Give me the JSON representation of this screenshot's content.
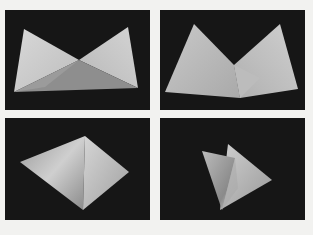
{
  "figure": {
    "background": "#f2f2f0",
    "panel_background": "#161616",
    "panels": [
      {
        "id": "top-left",
        "description": "flat bowtie fold",
        "x": 5,
        "y": 10,
        "w": 145,
        "h": 100
      },
      {
        "id": "top-right",
        "description": "M-shaped fold",
        "x": 160,
        "y": 10,
        "w": 145,
        "h": 100
      },
      {
        "id": "bottom-left",
        "description": "pyramid fold",
        "x": 5,
        "y": 118,
        "w": 145,
        "h": 102
      },
      {
        "id": "bottom-right",
        "description": "closing tetrahedral fold",
        "x": 160,
        "y": 118,
        "w": 145,
        "h": 102
      }
    ]
  }
}
